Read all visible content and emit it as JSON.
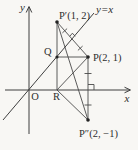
{
  "figure": {
    "type": "coordinate-geometry-diagram",
    "background": "#f8f7f4",
    "ink_color": "#3f3f3f",
    "labels": {
      "y_axis": "y",
      "x_axis": "x",
      "origin": "O",
      "line_y_eq_x": "y=x",
      "point_p": "P(2, 1)",
      "point_p_prime": "P′(1, 2)",
      "point_p_double_prime": "P″(2, −1)",
      "point_q": "Q",
      "point_r": "R"
    },
    "points_shown": [
      {
        "name": "P",
        "coords_text": "(2, 1)"
      },
      {
        "name": "P′",
        "coords_text": "(1, 2)"
      },
      {
        "name": "P″",
        "coords_text": "(2, −1)"
      }
    ],
    "relations": {
      "p_prime": "reflection of P across line y=x (right angle and equal tick marks on PP′)",
      "p_double_prime": "reflection of P across x-axis (right angle and equal tick marks on PP″)"
    }
  }
}
